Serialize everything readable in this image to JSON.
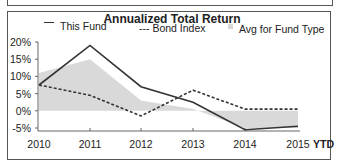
{
  "chart_data": {
    "type": "line",
    "title": "Annualized Total Return",
    "categories": [
      "2010",
      "2011",
      "2012",
      "2013",
      "2014",
      "2015"
    ],
    "x_suffix_label": "YTD",
    "series": [
      {
        "name": "This Fund",
        "style": "solid",
        "values": [
          7.5,
          19,
          7,
          2.5,
          -5.5,
          -4.5
        ]
      },
      {
        "name": "Bond Index",
        "style": "dashed",
        "values": [
          7.5,
          4.5,
          -1.5,
          6,
          0.5,
          0.5
        ]
      },
      {
        "name": "Avg for Fund Type",
        "style": "area",
        "values": [
          11,
          15,
          3,
          0.5,
          -5,
          -5
        ]
      }
    ],
    "yticks": [
      "20%",
      "15%",
      "10%",
      "5%",
      "0%",
      "-5%"
    ],
    "ylim": [
      -5,
      20
    ],
    "xlabel": "",
    "ylabel": "",
    "grid": false,
    "legend_position": "top"
  },
  "legend": {
    "fund_label": "This Fund",
    "bond_label": "--- Bond Index",
    "avg_label": "Avg for Fund Type"
  },
  "colors": {
    "fund": "#333333",
    "bond": "#333333",
    "avg_fill": "#d9d9d9",
    "axis": "#666666"
  }
}
